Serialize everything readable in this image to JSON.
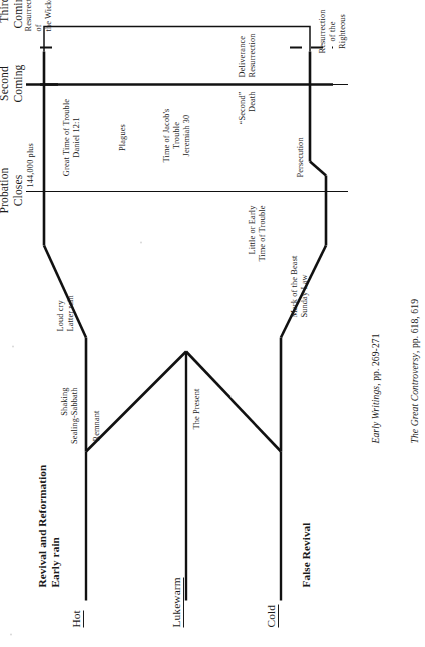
{
  "document": {
    "type": "prophetic-timeline-diagram",
    "orientation": "rotated-90-ccw",
    "background_color": "#ffffff",
    "line_color": "#111111"
  },
  "headers": {
    "probation_closes": "Probation\nCloses",
    "second_coming": "Second\nComing",
    "third_coming": "Third\nComing"
  },
  "titles": {
    "revival_and_reformation": "Revival and Reformation\nEarly rain",
    "false_revival": "False Revival"
  },
  "church_states": {
    "hot": "Hot",
    "lukewarm": "Lukewarm",
    "cold": "Cold"
  },
  "upper_branch": {
    "shaking_sealing": "Shaking\nSealing-Sabbath",
    "loud_cry": "Loud cry\nLatter rain",
    "remnant": "Remnant"
  },
  "lower_branch": {
    "the_present": "The Present",
    "mark_of_the_beast": "Mark of the Beast\nSunday Law",
    "little_time_of_trouble": "Little or Early\nTime of Trouble"
  },
  "upper_track": {
    "count_144000": "144,000 plus",
    "great_time_of_trouble": "Great Time of Trouble\nDaniel 12:1",
    "plagues": "Plagues"
  },
  "lower_track": {
    "jacobs_trouble": "Time of Jacob's\nTrouble\nJeremiah 30",
    "second_death": "“Second”\nDeath",
    "deliverance_resurrection": "Deliverance\nResurrection",
    "persecution": "Persecution"
  },
  "resurrections": {
    "righteous": "Resurrection\nof the\nRighteous",
    "wicked": "Resurrection\nof\nthe Wicked"
  },
  "citations": {
    "line1_title": "Early Writings",
    "line1_pages": ", pp. 269-271",
    "line2_title": "The Great Controversy",
    "line2_pages": ", pp. 618, 619"
  }
}
